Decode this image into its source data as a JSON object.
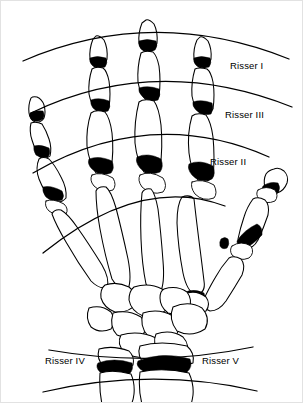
{
  "figure": {
    "type": "medical-illustration",
    "width": 303,
    "height": 403,
    "background_color": "#ffffff",
    "line_color": "#000000",
    "epiphysis_fill_color": "#000000"
  },
  "labels": [
    {
      "id": "risser-1",
      "text": "Risser I",
      "x": 229,
      "y": 68
    },
    {
      "id": "risser-3",
      "text": "Risser III",
      "x": 224,
      "y": 117
    },
    {
      "id": "risser-2",
      "text": "Risser II",
      "x": 209,
      "y": 164
    },
    {
      "id": "risser-4",
      "text": "Risser IV",
      "x": 44,
      "y": 363
    },
    {
      "id": "risser-5",
      "text": "Risser V",
      "x": 201,
      "y": 363
    }
  ],
  "arcs": [
    {
      "id": "arc-1",
      "label_ref": "risser-1",
      "orientation": "convex-up",
      "path": "M 22 60 Q 152 4 288 58"
    },
    {
      "id": "arc-2",
      "label_ref": "risser-3",
      "orientation": "convex-up",
      "path": "M 30 112 Q 155 52 291 106"
    },
    {
      "id": "arc-3",
      "label_ref": "risser-2",
      "orientation": "convex-up",
      "path": "M 32 172 Q 150 104 268 156"
    },
    {
      "id": "arc-4",
      "label_ref": "",
      "orientation": "convex-up",
      "path": "M 42 252 Q 140 173 224 205"
    },
    {
      "id": "arc-5",
      "label_ref": "risser-4",
      "orientation": "convex-down",
      "path": "M 48 349 Q 152 367 252 346"
    },
    {
      "id": "arc-6",
      "label_ref": "risser-5",
      "orientation": "convex-down",
      "path": "M 42 391 Q 152 366 256 390"
    }
  ],
  "digits": [
    {
      "id": "digit-little",
      "name": "little-finger",
      "segments": 3,
      "has_epiphyses": true
    },
    {
      "id": "digit-ring",
      "name": "ring-finger",
      "segments": 3,
      "has_epiphyses": true
    },
    {
      "id": "digit-middle",
      "name": "middle-finger",
      "segments": 3,
      "has_epiphyses": true
    },
    {
      "id": "digit-index",
      "name": "index-finger",
      "segments": 3,
      "has_epiphyses": true
    },
    {
      "id": "digit-thumb",
      "name": "thumb",
      "segments": 2,
      "has_epiphyses": true
    }
  ],
  "forearm": {
    "radius": {
      "id": "radius-bone",
      "epiphysis": true
    },
    "ulna": {
      "id": "ulna-bone",
      "epiphysis": true
    }
  }
}
